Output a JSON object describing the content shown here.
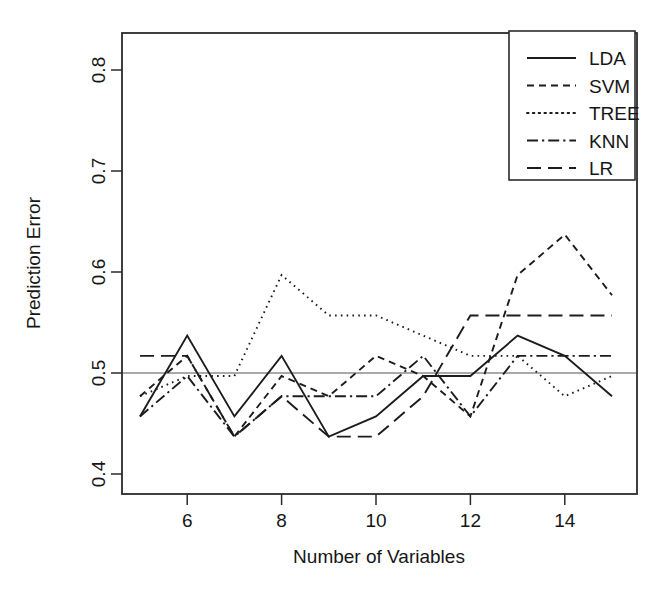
{
  "chart_data": {
    "type": "line",
    "title": "",
    "xlabel": "Number of Variables",
    "ylabel": "Prediction Error",
    "xlim": [
      5,
      15
    ],
    "ylim": [
      0.385,
      0.812
    ],
    "grid": false,
    "legend_position": "top-right",
    "reference_line": {
      "y": 0.5,
      "color": "#8d8d8d"
    },
    "x": [
      5,
      6,
      7,
      8,
      9,
      10,
      11,
      12,
      13,
      14,
      15
    ],
    "xticks": [
      6,
      8,
      10,
      12,
      14
    ],
    "xtick_labels": [
      "6",
      "8",
      "10",
      "12",
      "14"
    ],
    "yticks": [
      0.4,
      0.5,
      0.6,
      0.7,
      0.8
    ],
    "ytick_labels": [
      "0.4",
      "0.5",
      "0.6",
      "0.7",
      "0.8"
    ],
    "series": [
      {
        "name": "LDA",
        "dash": "solid",
        "values": [
          0.457,
          0.537,
          0.457,
          0.517,
          0.437,
          0.457,
          0.497,
          0.497,
          0.537,
          0.517,
          0.477
        ]
      },
      {
        "name": "SVM",
        "dash": "dashed-short",
        "values": [
          0.477,
          0.517,
          0.437,
          0.497,
          0.477,
          0.517,
          0.497,
          0.457,
          0.597,
          0.637,
          0.577
        ]
      },
      {
        "name": "TREE",
        "dash": "dotted",
        "values": [
          0.477,
          0.497,
          0.497,
          0.597,
          0.557,
          0.557,
          0.537,
          0.517,
          0.517,
          0.477,
          0.497
        ]
      },
      {
        "name": "KNN",
        "dash": "dash-dot",
        "values": [
          0.457,
          0.497,
          0.437,
          0.477,
          0.477,
          0.477,
          0.517,
          0.457,
          0.517,
          0.517,
          0.517
        ]
      },
      {
        "name": "LR",
        "dash": "dashed-long",
        "values": [
          0.517,
          0.517,
          0.437,
          0.477,
          0.437,
          0.437,
          0.477,
          0.557,
          0.557,
          0.557,
          0.557
        ]
      }
    ]
  },
  "axes": {
    "x_title": "Number of Variables",
    "y_title": "Prediction Error"
  },
  "legend": {
    "entries": [
      {
        "label": "LDA",
        "dash": "solid"
      },
      {
        "label": "SVM",
        "dash": "dashed-short"
      },
      {
        "label": "TREE",
        "dash": "dotted"
      },
      {
        "label": "KNN",
        "dash": "dash-dot"
      },
      {
        "label": "LR",
        "dash": "dashed-long"
      }
    ]
  },
  "colors": {
    "ink": "#1c1c1c",
    "axis": "#2b2b2b",
    "reference": "#8d8d8d",
    "background": "#ffffff"
  }
}
